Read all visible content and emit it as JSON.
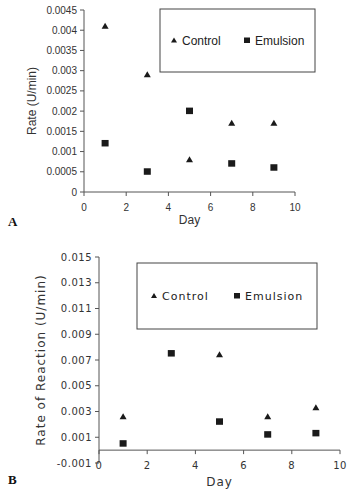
{
  "chart_data": [
    {
      "panel": "A",
      "type": "scatter",
      "title": "",
      "xlabel": "Day",
      "ylabel": "Rate (U/min)",
      "xlim": [
        0,
        10
      ],
      "ylim": [
        0,
        0.0045
      ],
      "x_ticks": [
        "0",
        "2",
        "4",
        "6",
        "8",
        "10"
      ],
      "y_ticks": [
        "0",
        "0.0005",
        "0.001",
        "0.0015",
        "0.002",
        "0.0025",
        "0.003",
        "0.0035",
        "0.004",
        "0.0045"
      ],
      "grid": false,
      "legend_position": "top-right (boxed)",
      "series": [
        {
          "name": "Control",
          "marker": "triangle",
          "x": [
            1,
            3,
            5,
            7,
            9
          ],
          "values": [
            0.0041,
            0.0029,
            0.0008,
            0.0017,
            0.0017
          ]
        },
        {
          "name": "Emulsion",
          "marker": "square",
          "x": [
            1,
            3,
            5,
            7,
            9
          ],
          "values": [
            0.0012,
            0.0005,
            0.002,
            0.0007,
            0.0006
          ]
        }
      ]
    },
    {
      "panel": "B",
      "type": "scatter",
      "title": "",
      "xlabel": "Day",
      "ylabel": "Rate of Reaction (U/min)",
      "xlim": [
        0,
        10
      ],
      "ylim": [
        -0.001,
        0.015
      ],
      "x_ticks": [
        "0",
        "2",
        "4",
        "6",
        "8",
        "10"
      ],
      "y_ticks": [
        "-0.001",
        "0.001",
        "0.003",
        "0.005",
        "0.007",
        "0.009",
        "0.011",
        "0.013",
        "0.015"
      ],
      "grid": false,
      "legend_position": "top-right (boxed)",
      "series": [
        {
          "name": "Control",
          "marker": "triangle",
          "x": [
            1,
            5,
            7,
            9
          ],
          "values": [
            0.0026,
            0.0074,
            0.0026,
            0.0033
          ]
        },
        {
          "name": "Emulsion",
          "marker": "square",
          "x": [
            1,
            3,
            5,
            7,
            9
          ],
          "values": [
            0.0005,
            0.0075,
            0.0022,
            0.0012,
            0.0013
          ]
        }
      ]
    }
  ],
  "panels": {
    "a": {
      "letter": "A",
      "xlabel": "Day",
      "ylabel": "Rate (U/min)",
      "legend": [
        "Control",
        "Emulsion"
      ]
    },
    "b": {
      "letter": "B",
      "xlabel": "Day",
      "ylabel": "Rate of Reaction (U/min)",
      "legend": [
        "Control",
        "Emulsion"
      ]
    }
  },
  "colors": {
    "marker": "#1a1a1a",
    "axis": "#555555",
    "legend_border": "#444444"
  }
}
